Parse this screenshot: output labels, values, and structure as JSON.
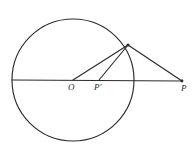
{
  "figure": {
    "kind": "geometry-diagram",
    "background_color": "#ffffff",
    "stroke_color": "#2b2b2b",
    "canvas": {
      "width": 196,
      "height": 152
    },
    "circle": {
      "center_x": 73,
      "center_y": 80,
      "radius": 61
    },
    "points": {
      "center": {
        "label": "O",
        "prime": "",
        "x": 73,
        "y": 80,
        "label_x": 68,
        "label_y": 83
      },
      "inner": {
        "label": "P",
        "prime": "′",
        "x": 99,
        "y": 80,
        "label_x": 94,
        "label_y": 83
      },
      "outer": {
        "label": "P",
        "prime": "",
        "x": 182,
        "y": 81,
        "label_x": 181,
        "label_y": 84
      },
      "tangent": {
        "label": "",
        "prime": "",
        "x": 128,
        "y": 45
      }
    },
    "segments": [
      {
        "name": "horizontal-axis",
        "x1": 12,
        "y1": 80,
        "x2": 182,
        "y2": 81
      },
      {
        "name": "radius-to-tangent",
        "x1": 73,
        "y1": 80,
        "x2": 128,
        "y2": 45
      },
      {
        "name": "inner-point-to-tangent",
        "x1": 99,
        "y1": 80,
        "x2": 128,
        "y2": 45
      },
      {
        "name": "tangent-to-outer-point",
        "x1": 128,
        "y1": 45,
        "x2": 182,
        "y2": 81
      }
    ]
  }
}
